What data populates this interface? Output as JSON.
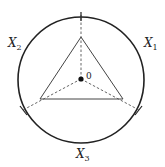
{
  "diagram": {
    "type": "geometric-figure",
    "center_label": "0",
    "labels": [
      {
        "id": "x1",
        "base": "X",
        "subscript": "1"
      },
      {
        "id": "x2",
        "base": "X",
        "subscript": "2"
      },
      {
        "id": "x3",
        "base": "X",
        "subscript": "3"
      }
    ],
    "colors": {
      "circle": "#222222",
      "triangle": "#444444",
      "dashed": "#555555",
      "text": "#222222"
    }
  }
}
